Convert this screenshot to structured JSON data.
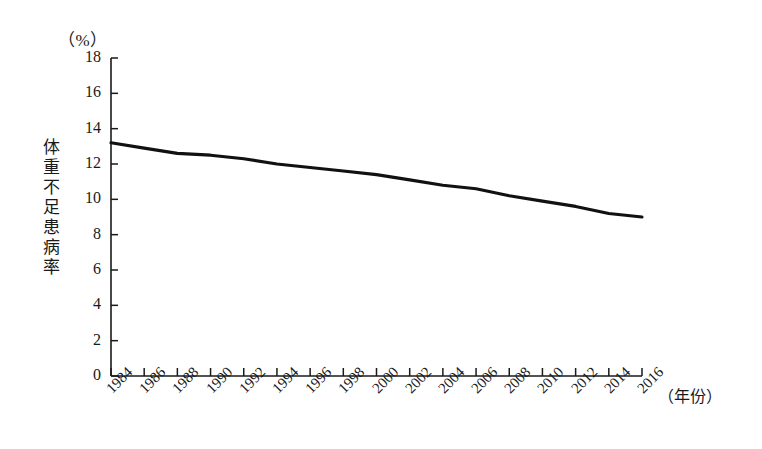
{
  "chart_data": {
    "type": "line",
    "title": "",
    "unit_label": "（%）",
    "ylabel": "体重不足患病率",
    "xlabel": "（年份）",
    "ylim": [
      0,
      18
    ],
    "y_ticks": [
      0,
      2,
      4,
      6,
      8,
      10,
      12,
      14,
      16,
      18
    ],
    "grid": false,
    "legend": "none",
    "line_color": "#111111",
    "categories": [
      "1984",
      "1986",
      "1988",
      "1990",
      "1992",
      "1994",
      "1996",
      "1998",
      "2000",
      "2002",
      "2004",
      "2006",
      "2008",
      "2010",
      "2012",
      "2014",
      "2016"
    ],
    "x": [
      1984,
      1986,
      1988,
      1990,
      1992,
      1994,
      1996,
      1998,
      2000,
      2002,
      2004,
      2006,
      2008,
      2010,
      2012,
      2014,
      2016
    ],
    "values": [
      13.2,
      12.9,
      12.6,
      12.5,
      12.3,
      12.0,
      11.8,
      11.6,
      11.4,
      11.1,
      10.8,
      10.6,
      10.2,
      9.9,
      9.6,
      9.2,
      9.0
    ],
    "series": [
      {
        "name": "体重不足患病率",
        "values": [
          13.2,
          12.9,
          12.6,
          12.5,
          12.3,
          12.0,
          11.8,
          11.6,
          11.4,
          11.1,
          10.8,
          10.6,
          10.2,
          9.9,
          9.6,
          9.2,
          9.0
        ]
      }
    ]
  },
  "axes": {
    "y_tick_labels": [
      "18",
      "16",
      "14",
      "12",
      "10",
      "8",
      "6",
      "4",
      "2",
      "0"
    ],
    "x_tick_labels": [
      "1984",
      "1986",
      "1988",
      "1990",
      "1992",
      "1994",
      "1996",
      "1998",
      "2000",
      "2002",
      "2004",
      "2006",
      "2008",
      "2010",
      "2012",
      "2014",
      "2016"
    ]
  }
}
